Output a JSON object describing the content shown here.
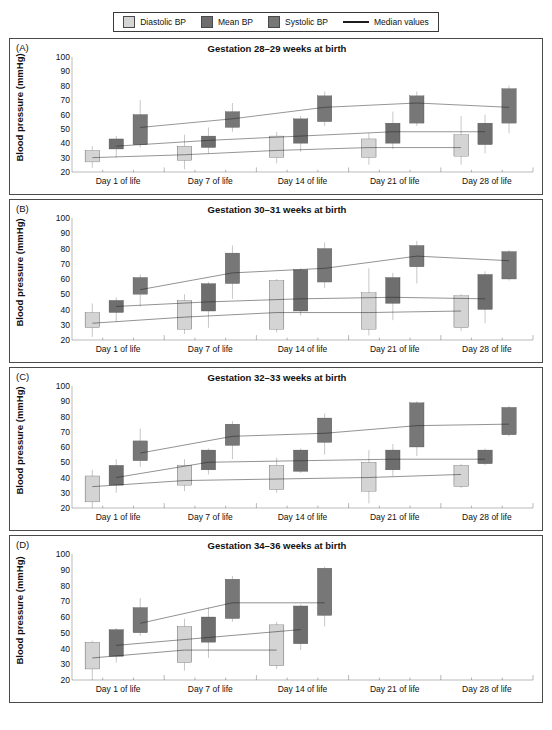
{
  "legend": {
    "items": [
      {
        "label": "Diastolic BP",
        "type": "swatch",
        "color": "#d4d4d4",
        "icon": "square-swatch-icon"
      },
      {
        "label": "Mean BP",
        "type": "swatch",
        "color": "#6e6e6e",
        "icon": "square-swatch-icon"
      },
      {
        "label": "Systolic BP",
        "type": "swatch",
        "color": "#777777",
        "icon": "square-swatch-icon"
      },
      {
        "label": "Median values",
        "type": "line",
        "color": "#1c1c1c",
        "icon": "line-sample-icon"
      }
    ]
  },
  "chart_data": [
    {
      "type": "box",
      "panel": "A",
      "tag": "(A)",
      "title": "Gestation 28–29 weeks at birth",
      "xlabel": "",
      "ylabel": "Blood pressure (mmHg)",
      "ylim": [
        20,
        100
      ],
      "yticks": [
        100,
        90,
        80,
        70,
        60,
        50,
        40,
        30,
        20
      ],
      "categories": [
        "Day 1 of life",
        "Day 7 of life",
        "Day 14 of life",
        "Day 21 of life",
        "Day 28 of life"
      ],
      "grid": false,
      "legend_position": "top-outside",
      "series": [
        {
          "name": "Diastolic BP",
          "color": "#d4d4d4",
          "boxes": [
            {
              "category": "Day 1 of life",
              "whisker_low": 23,
              "q1": 27,
              "median": 30,
              "q3": 35,
              "whisker_high": 38
            },
            {
              "category": "Day 7 of life",
              "whisker_low": 22,
              "q1": 28,
              "median": 32,
              "q3": 38,
              "whisker_high": 46
            },
            {
              "category": "Day 14 of life",
              "whisker_low": 26,
              "q1": 30,
              "median": 35,
              "q3": 45,
              "whisker_high": 48
            },
            {
              "category": "Day 21 of life",
              "whisker_low": 25,
              "q1": 30,
              "median": 37,
              "q3": 43,
              "whisker_high": 47
            },
            {
              "category": "Day 28 of life",
              "whisker_low": 25,
              "q1": 31,
              "median": 37,
              "q3": 46,
              "whisker_high": 59
            }
          ],
          "median_values": [
            30,
            32,
            35,
            37,
            37
          ]
        },
        {
          "name": "Mean BP",
          "color": "#6e6e6e",
          "boxes": [
            {
              "category": "Day 1 of life",
              "whisker_low": 30,
              "q1": 36,
              "median": 38,
              "q3": 43,
              "whisker_high": 45
            },
            {
              "category": "Day 7 of life",
              "whisker_low": 33,
              "q1": 37,
              "median": 42,
              "q3": 45,
              "whisker_high": 51
            },
            {
              "category": "Day 14 of life",
              "whisker_low": 34,
              "q1": 40,
              "median": 45,
              "q3": 57,
              "whisker_high": 59
            },
            {
              "category": "Day 21 of life",
              "whisker_low": 36,
              "q1": 40,
              "median": 48,
              "q3": 54,
              "whisker_high": 62
            },
            {
              "category": "Day 28 of life",
              "whisker_low": 33,
              "q1": 39,
              "median": 48,
              "q3": 54,
              "whisker_high": 60
            }
          ],
          "median_values": [
            38,
            42,
            45,
            48,
            48
          ]
        },
        {
          "name": "Systolic BP",
          "color": "#777777",
          "boxes": [
            {
              "category": "Day 1 of life",
              "whisker_low": 37,
              "q1": 39,
              "median": 51,
              "q3": 60,
              "whisker_high": 70
            },
            {
              "category": "Day 7 of life",
              "whisker_low": 48,
              "q1": 51,
              "median": 57,
              "q3": 62,
              "whisker_high": 68
            },
            {
              "category": "Day 14 of life",
              "whisker_low": 52,
              "q1": 55,
              "median": 65,
              "q3": 73,
              "whisker_high": 76
            },
            {
              "category": "Day 21 of life",
              "whisker_low": 52,
              "q1": 54,
              "median": 68,
              "q3": 73,
              "whisker_high": 76
            },
            {
              "category": "Day 28 of life",
              "whisker_low": 47,
              "q1": 54,
              "median": 65,
              "q3": 78,
              "whisker_high": 80
            }
          ],
          "median_values": [
            51,
            57,
            65,
            68,
            65
          ]
        }
      ]
    },
    {
      "type": "box",
      "panel": "B",
      "tag": "(B)",
      "title": "Gestation 30–31 weeks at birth",
      "xlabel": "",
      "ylabel": "Blood pressure (mmHg)",
      "ylim": [
        20,
        100
      ],
      "yticks": [
        100,
        90,
        80,
        70,
        60,
        50,
        40,
        30,
        20
      ],
      "categories": [
        "Day 1 of life",
        "Day 7 of life",
        "Day 14 of life",
        "Day 21 of life",
        "Day 28 of life"
      ],
      "grid": false,
      "legend_position": "top-outside",
      "series": [
        {
          "name": "Diastolic BP",
          "color": "#d4d4d4",
          "boxes": [
            {
              "category": "Day 1 of life",
              "whisker_low": 22,
              "q1": 28,
              "median": 31,
              "q3": 38,
              "whisker_high": 44
            },
            {
              "category": "Day 7 of life",
              "whisker_low": 24,
              "q1": 27,
              "median": 35,
              "q3": 46,
              "whisker_high": 50
            },
            {
              "category": "Day 14 of life",
              "whisker_low": 25,
              "q1": 27,
              "median": 38,
              "q3": 59,
              "whisker_high": 60
            },
            {
              "category": "Day 21 of life",
              "whisker_low": 23,
              "q1": 27,
              "median": 38,
              "q3": 51,
              "whisker_high": 67
            },
            {
              "category": "Day 28 of life",
              "whisker_low": 26,
              "q1": 28,
              "median": 39,
              "q3": 49,
              "whisker_high": 50
            }
          ],
          "median_values": [
            31,
            35,
            38,
            38,
            39
          ]
        },
        {
          "name": "Mean BP",
          "color": "#6e6e6e",
          "boxes": [
            {
              "category": "Day 1 of life",
              "whisker_low": 32,
              "q1": 38,
              "median": 42,
              "q3": 46,
              "whisker_high": 48
            },
            {
              "category": "Day 7 of life",
              "whisker_low": 28,
              "q1": 39,
              "median": 45,
              "q3": 57,
              "whisker_high": 58
            },
            {
              "category": "Day 14 of life",
              "whisker_low": 36,
              "q1": 39,
              "median": 47,
              "q3": 66,
              "whisker_high": 67
            },
            {
              "category": "Day 21 of life",
              "whisker_low": 33,
              "q1": 44,
              "median": 48,
              "q3": 61,
              "whisker_high": 64
            },
            {
              "category": "Day 28 of life",
              "whisker_low": 31,
              "q1": 40,
              "median": 47,
              "q3": 63,
              "whisker_high": 65
            }
          ],
          "median_values": [
            42,
            45,
            47,
            48,
            47
          ]
        },
        {
          "name": "Systolic BP",
          "color": "#777777",
          "boxes": [
            {
              "category": "Day 1 of life",
              "whisker_low": 42,
              "q1": 50,
              "median": 53,
              "q3": 61,
              "whisker_high": 63
            },
            {
              "category": "Day 7 of life",
              "whisker_low": 47,
              "q1": 57,
              "median": 64,
              "q3": 77,
              "whisker_high": 82
            },
            {
              "category": "Day 14 of life",
              "whisker_low": 54,
              "q1": 58,
              "median": 67,
              "q3": 80,
              "whisker_high": 84
            },
            {
              "category": "Day 21 of life",
              "whisker_low": 57,
              "q1": 68,
              "median": 75,
              "q3": 82,
              "whisker_high": 85
            },
            {
              "category": "Day 28 of life",
              "whisker_low": 59,
              "q1": 60,
              "median": 72,
              "q3": 78,
              "whisker_high": 79
            }
          ],
          "median_values": [
            53,
            64,
            67,
            75,
            72
          ]
        }
      ]
    },
    {
      "type": "box",
      "panel": "C",
      "tag": "(C)",
      "title": "Gestation 32–33 weeks at birth",
      "xlabel": "",
      "ylabel": "Blood pressure (mmHg)",
      "ylim": [
        20,
        100
      ],
      "yticks": [
        100,
        90,
        80,
        70,
        60,
        50,
        40,
        30,
        20
      ],
      "categories": [
        "Day 1 of life",
        "Day 7 of life",
        "Day 14 of life",
        "Day 21 of life",
        "Day 28 of life"
      ],
      "grid": false,
      "legend_position": "top-outside",
      "series": [
        {
          "name": "Diastolic BP",
          "color": "#d4d4d4",
          "boxes": [
            {
              "category": "Day 1 of life",
              "whisker_low": 20,
              "q1": 24,
              "median": 34,
              "q3": 41,
              "whisker_high": 45
            },
            {
              "category": "Day 7 of life",
              "whisker_low": 31,
              "q1": 35,
              "median": 38,
              "q3": 48,
              "whisker_high": 52
            },
            {
              "category": "Day 14 of life",
              "whisker_low": 30,
              "q1": 32,
              "median": 39,
              "q3": 48,
              "whisker_high": 53
            },
            {
              "category": "Day 21 of life",
              "whisker_low": 23,
              "q1": 31,
              "median": 40,
              "q3": 50,
              "whisker_high": 58
            },
            {
              "category": "Day 28 of life",
              "whisker_low": 33,
              "q1": 34,
              "median": 42,
              "q3": 48,
              "whisker_high": 49
            }
          ],
          "median_values": [
            34,
            38,
            39,
            40,
            42
          ]
        },
        {
          "name": "Mean BP",
          "color": "#6e6e6e",
          "boxes": [
            {
              "category": "Day 1 of life",
              "whisker_low": 30,
              "q1": 35,
              "median": 40,
              "q3": 48,
              "whisker_high": 52
            },
            {
              "category": "Day 7 of life",
              "whisker_low": 42,
              "q1": 45,
              "median": 50,
              "q3": 58,
              "whisker_high": 59
            },
            {
              "category": "Day 14 of life",
              "whisker_low": 43,
              "q1": 44,
              "median": 51,
              "q3": 58,
              "whisker_high": 59
            },
            {
              "category": "Day 21 of life",
              "whisker_low": 41,
              "q1": 45,
              "median": 52,
              "q3": 58,
              "whisker_high": 62
            },
            {
              "category": "Day 28 of life",
              "whisker_low": 48,
              "q1": 49,
              "median": 52,
              "q3": 58,
              "whisker_high": 59
            }
          ],
          "median_values": [
            40,
            50,
            51,
            52,
            52
          ]
        },
        {
          "name": "Systolic BP",
          "color": "#777777",
          "boxes": [
            {
              "category": "Day 1 of life",
              "whisker_low": 47,
              "q1": 51,
              "median": 56,
              "q3": 64,
              "whisker_high": 72
            },
            {
              "category": "Day 7 of life",
              "whisker_low": 52,
              "q1": 61,
              "median": 67,
              "q3": 75,
              "whisker_high": 77
            },
            {
              "category": "Day 14 of life",
              "whisker_low": 55,
              "q1": 63,
              "median": 69,
              "q3": 79,
              "whisker_high": 82
            },
            {
              "category": "Day 21 of life",
              "whisker_low": 54,
              "q1": 60,
              "median": 74,
              "q3": 89,
              "whisker_high": 90
            },
            {
              "category": "Day 28 of life",
              "whisker_low": 67,
              "q1": 68,
              "median": 75,
              "q3": 86,
              "whisker_high": 87
            }
          ],
          "median_values": [
            56,
            67,
            69,
            74,
            75
          ]
        }
      ]
    },
    {
      "type": "box",
      "panel": "D",
      "tag": "(D)",
      "title": "Gestation 34–36 weeks at birth",
      "xlabel": "",
      "ylabel": "Blood pressure (mmHg)",
      "ylim": [
        20,
        100
      ],
      "yticks": [
        100,
        90,
        80,
        70,
        60,
        50,
        40,
        30,
        20
      ],
      "categories": [
        "Day 1 of life",
        "Day 7 of life",
        "Day 14 of life",
        "Day 21 of life",
        "Day 28 of life"
      ],
      "grid": false,
      "legend_position": "top-outside",
      "series": [
        {
          "name": "Diastolic BP",
          "color": "#d4d4d4",
          "boxes": [
            {
              "category": "Day 1 of life",
              "whisker_low": 20,
              "q1": 27,
              "median": 34,
              "q3": 44,
              "whisker_high": 45
            },
            {
              "category": "Day 7 of life",
              "whisker_low": 26,
              "q1": 31,
              "median": 39,
              "q3": 54,
              "whisker_high": 59
            },
            {
              "category": "Day 14 of life",
              "whisker_low": 27,
              "q1": 29,
              "median": 39,
              "q3": 55,
              "whisker_high": 57
            },
            {
              "category": "Day 21 of life",
              "whisker_low": null,
              "q1": null,
              "median": null,
              "q3": null,
              "whisker_high": null
            },
            {
              "category": "Day 28 of life",
              "whisker_low": null,
              "q1": null,
              "median": null,
              "q3": null,
              "whisker_high": null
            }
          ],
          "median_values": [
            34,
            39,
            39,
            null,
            null
          ]
        },
        {
          "name": "Mean BP",
          "color": "#6e6e6e",
          "boxes": [
            {
              "category": "Day 1 of life",
              "whisker_low": 31,
              "q1": 35,
              "median": 42,
              "q3": 52,
              "whisker_high": 53
            },
            {
              "category": "Day 7 of life",
              "whisker_low": 34,
              "q1": 44,
              "median": 47,
              "q3": 60,
              "whisker_high": 66
            },
            {
              "category": "Day 14 of life",
              "whisker_low": 39,
              "q1": 43,
              "median": 52,
              "q3": 67,
              "whisker_high": 68
            },
            {
              "category": "Day 21 of life",
              "whisker_low": null,
              "q1": null,
              "median": null,
              "q3": null,
              "whisker_high": null
            },
            {
              "category": "Day 28 of life",
              "whisker_low": null,
              "q1": null,
              "median": null,
              "q3": null,
              "whisker_high": null
            }
          ],
          "median_values": [
            42,
            47,
            52,
            null,
            null
          ]
        },
        {
          "name": "Systolic BP",
          "color": "#777777",
          "boxes": [
            {
              "category": "Day 1 of life",
              "whisker_low": 48,
              "q1": 50,
              "median": 56,
              "q3": 66,
              "whisker_high": 72
            },
            {
              "category": "Day 7 of life",
              "whisker_low": 57,
              "q1": 59,
              "median": 69,
              "q3": 84,
              "whisker_high": 86
            },
            {
              "category": "Day 14 of life",
              "whisker_low": 54,
              "q1": 61,
              "median": 69,
              "q3": 91,
              "whisker_high": 92
            },
            {
              "category": "Day 21 of life",
              "whisker_low": null,
              "q1": null,
              "median": null,
              "q3": null,
              "whisker_high": null
            },
            {
              "category": "Day 28 of life",
              "whisker_low": null,
              "q1": null,
              "median": null,
              "q3": null,
              "whisker_high": null
            }
          ],
          "median_values": [
            56,
            69,
            69,
            null,
            null
          ]
        }
      ]
    }
  ]
}
